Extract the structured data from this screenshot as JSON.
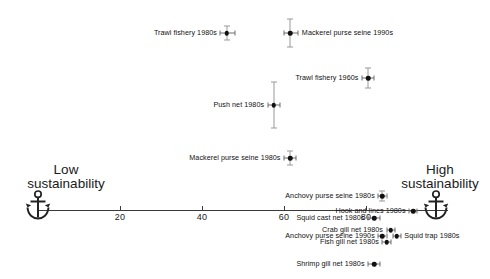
{
  "chart_data": {
    "type": "scatter",
    "title": "",
    "subtitle": "",
    "xlabel": "",
    "ylabel": "",
    "xlim": [
      0,
      100
    ],
    "grid": false,
    "legend": null,
    "axis_ticks": [
      "20",
      "40",
      "60",
      "80"
    ],
    "axis_tick_values": [
      20,
      40,
      60,
      80
    ],
    "pole_low": "Low\nsustainability",
    "pole_low_line1": "Low",
    "pole_low_line2": "sustainability",
    "pole_high_line1": "High",
    "pole_high_line2": "sustainability",
    "anchor_icon_name": "anchor-icon",
    "points": [
      {
        "label": "Trawl fishery 1980s",
        "x": 46.0,
        "err_low": 44.5,
        "err_high": 48.0,
        "err_v": 14,
        "side": "left"
      },
      {
        "label": "Mackerel purse seine 1990s",
        "x": 61.5,
        "err_low": 60.0,
        "err_high": 63.5,
        "err_v": 28,
        "side": "right"
      },
      {
        "label": "Trawl fishery 1960s",
        "x": 80.5,
        "err_low": 79.0,
        "err_high": 82.0,
        "err_v": 20,
        "side": "left"
      },
      {
        "label": "Push net 1980s",
        "x": 57.5,
        "err_low": 56.0,
        "err_high": 59.0,
        "err_v": 46,
        "side": "left"
      },
      {
        "label": "Mackerel purse seine 1980s",
        "x": 61.5,
        "err_low": 60.0,
        "err_high": 63.0,
        "err_v": 14,
        "side": "left"
      },
      {
        "label": "Anchovy purse seine 1980s",
        "x": 84.0,
        "err_low": 83.0,
        "err_high": 85.0,
        "err_v": 10,
        "side": "left"
      },
      {
        "label": "Hook and lines 1980s",
        "x": 91.5,
        "err_low": 90.5,
        "err_high": 92.5,
        "err_v": 0,
        "side": "left"
      },
      {
        "label": "Squid cast net 1980s",
        "x": 82.0,
        "err_low": 80.5,
        "err_high": 83.5,
        "err_v": 0,
        "side": "left"
      },
      {
        "label": "Crab gill net 1980s",
        "x": 86.0,
        "err_low": 85.0,
        "err_high": 87.0,
        "err_v": 0,
        "side": "left"
      },
      {
        "label": "Anchovy purse seine 1990s",
        "x": 84.0,
        "err_low": 83.0,
        "err_high": 85.0,
        "err_v": 0,
        "side": "left"
      },
      {
        "label": "Squid trap 1980s",
        "x": 87.5,
        "err_low": 86.5,
        "err_high": 88.5,
        "err_v": 0,
        "side": "right"
      },
      {
        "label": "Fish gill net 1980s",
        "x": 85.0,
        "err_low": 84.0,
        "err_high": 86.0,
        "err_v": 0,
        "side": "left"
      },
      {
        "label": "Shrimp gill net 1980s",
        "x": 82.0,
        "err_low": 80.5,
        "err_high": 83.5,
        "err_v": 0,
        "side": "left"
      }
    ],
    "colors": {
      "point": "#111111",
      "axis": "#3a3a3a",
      "error_bar": "#8a8a8a",
      "text": "#1a1a1a",
      "background": "#ffffff"
    }
  }
}
